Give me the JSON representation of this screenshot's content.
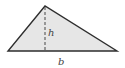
{
  "diagram": {
    "type": "triangle",
    "vertices": {
      "apex": [
        45,
        6
      ],
      "base_left": [
        8,
        51
      ],
      "base_right": [
        117,
        51
      ]
    },
    "labels": {
      "height": "h",
      "base": "b"
    },
    "colors": {
      "fill": "#e6e6e6",
      "stroke": "#2e2e2e",
      "dashed": "#555555",
      "label": "#444444"
    }
  }
}
